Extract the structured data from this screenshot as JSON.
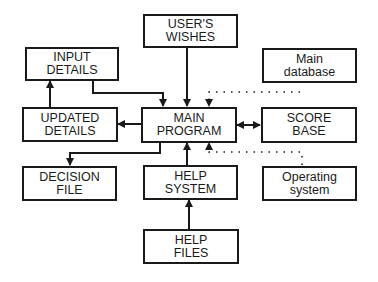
{
  "diagram": {
    "nodes": {
      "users_wishes": {
        "line1": "USER'S",
        "line2": "WISHES"
      },
      "input_details": {
        "line1": "INPUT",
        "line2": "DETAILS"
      },
      "main_database": {
        "line1": "Main",
        "line2": "database"
      },
      "updated_details": {
        "line1": "UPDATED",
        "line2": "DETAILS"
      },
      "main_program": {
        "line1": "MAIN",
        "line2": "PROGRAM"
      },
      "score_base": {
        "line1": "SCORE",
        "line2": "BASE"
      },
      "decision_file": {
        "line1": "DECISION",
        "line2": "FILE"
      },
      "help_system": {
        "line1": "HELP",
        "line2": "SYSTEM"
      },
      "operating_system": {
        "line1": "Operating",
        "line2": "system"
      },
      "help_files": {
        "line1": "HELP",
        "line2": "FILES"
      }
    },
    "edges": [
      {
        "from": "USER'S WISHES",
        "to": "MAIN PROGRAM",
        "style": "solid"
      },
      {
        "from": "INPUT DETAILS",
        "to": "MAIN PROGRAM",
        "style": "solid"
      },
      {
        "from": "Main database",
        "to": "MAIN PROGRAM",
        "style": "dotted"
      },
      {
        "from": "MAIN PROGRAM",
        "to": "UPDATED DETAILS",
        "style": "solid"
      },
      {
        "from": "UPDATED DETAILS",
        "to": "INPUT DETAILS",
        "style": "solid"
      },
      {
        "from": "MAIN PROGRAM",
        "to": "SCORE BASE",
        "style": "solid",
        "bidirectional": true
      },
      {
        "from": "MAIN PROGRAM",
        "to": "DECISION FILE",
        "style": "solid"
      },
      {
        "from": "HELP SYSTEM",
        "to": "MAIN PROGRAM",
        "style": "solid"
      },
      {
        "from": "Operating system",
        "to": "MAIN PROGRAM",
        "style": "dotted"
      },
      {
        "from": "HELP FILES",
        "to": "HELP SYSTEM",
        "style": "solid"
      }
    ],
    "colors": {
      "ink": "#1a1a1a",
      "background": "#ffffff"
    }
  }
}
